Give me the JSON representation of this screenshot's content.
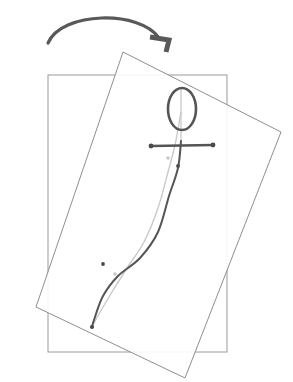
{
  "canvas": {
    "width": 293,
    "height": 382,
    "background": "#ffffff",
    "title": "Rotated rectangle with stick-figure pose and rotation arrow"
  },
  "colors": {
    "frame_static": "#9a9a9a",
    "frame_rotated": "#8f8f8f",
    "arrow": "#595959",
    "figure_dark": "#555555",
    "figure_light": "#c9c9c9",
    "dot": "#4a4a4a"
  },
  "strokes": {
    "frame_static_width": 1,
    "frame_rotated_width": 1,
    "arrow_width": 3.2,
    "head_width": 2.6,
    "bar_width": 2.6,
    "spine_width": 2,
    "spine_light_width": 1.4
  },
  "rotation_arrow": {
    "label": "rotation-direction-arrow",
    "start": [
      48,
      43
    ],
    "apex": [
      101,
      15
    ],
    "end": [
      159,
      38
    ],
    "control_1": [
      62,
      11
    ],
    "control_2": [
      140,
      10
    ],
    "arrowhead": {
      "corner": [
        169,
        40
      ],
      "arm_left": [
        150,
        37
      ],
      "arm_down": [
        166,
        52
      ],
      "thickness": 5
    }
  },
  "static_rect": {
    "label": "static-bounding-rectangle",
    "x": 48,
    "y": 75,
    "width": 179,
    "height": 277
  },
  "rotated_rect": {
    "label": "rotated-bounding-rectangle",
    "angle_deg": 18.5,
    "corners": [
      [
        123,
        52
      ],
      [
        281,
        132
      ],
      [
        185,
        378
      ],
      [
        36,
        307
      ]
    ]
  },
  "figure": {
    "head": {
      "label": "head-ellipse",
      "cx": 182,
      "cy": 109,
      "rx": 14,
      "ry": 21
    },
    "arms": {
      "label": "arms-bar",
      "x1": 151,
      "y1": 146,
      "x2": 213,
      "y2": 145,
      "endpoint_radius": 2.4
    },
    "spine_dark": {
      "label": "spine-curve-dark",
      "points": [
        [
          181,
          141
        ],
        [
          178,
          168
        ],
        [
          169,
          196
        ],
        [
          158,
          232
        ],
        [
          140,
          258
        ],
        [
          118,
          276
        ],
        [
          103,
          296
        ],
        [
          94,
          320
        ],
        [
          92,
          327
        ]
      ]
    },
    "spine_light": {
      "label": "spine-curve-light",
      "points": [
        [
          181,
          112
        ],
        [
          175,
          145
        ],
        [
          168,
          172
        ],
        [
          158,
          208
        ],
        [
          144,
          242
        ],
        [
          127,
          268
        ],
        [
          112,
          292
        ],
        [
          99,
          314
        ],
        [
          92,
          327
        ]
      ]
    },
    "control_dots": [
      {
        "label": "control-dot-1",
        "cx": 168,
        "cy": 158,
        "r": 1.8,
        "tone": "light"
      },
      {
        "label": "control-dot-2",
        "cx": 178,
        "cy": 166,
        "r": 1.9,
        "tone": "dark"
      },
      {
        "label": "control-dot-3",
        "cx": 103,
        "cy": 264,
        "r": 1.9,
        "tone": "dark"
      },
      {
        "label": "control-dot-4",
        "cx": 115,
        "cy": 274,
        "r": 1.8,
        "tone": "light"
      },
      {
        "label": "control-dot-endpoint",
        "cx": 92,
        "cy": 327,
        "r": 2.1,
        "tone": "dark"
      }
    ],
    "neck_line": {
      "label": "neck-line",
      "x1": 181,
      "y1": 88,
      "x2": 181,
      "y2": 142
    }
  }
}
